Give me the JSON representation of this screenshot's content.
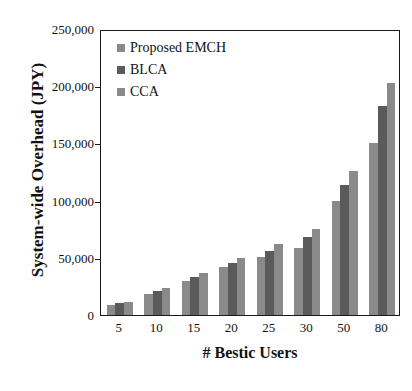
{
  "chart_data": {
    "type": "bar",
    "title": "",
    "xlabel": "# Bestic Users",
    "ylabel": "System-wide Overhead (JPY)",
    "categories": [
      "5",
      "10",
      "15",
      "20",
      "25",
      "30",
      "50",
      "80"
    ],
    "series": [
      {
        "name": "Proposed EMCH",
        "color": "#8a8a8a",
        "values": [
          9000,
          18000,
          30000,
          42000,
          51000,
          59000,
          100000,
          150000
        ]
      },
      {
        "name": "BLCA",
        "color": "#5a5a5a",
        "values": [
          10500,
          21000,
          33000,
          45500,
          56000,
          68000,
          114000,
          183000
        ]
      },
      {
        "name": "CCA",
        "color": "#8a8a8a",
        "values": [
          11500,
          24000,
          37000,
          50000,
          62000,
          75000,
          126000,
          203000
        ]
      }
    ],
    "ylim": [
      0,
      250000
    ],
    "yticks": [
      0,
      50000,
      100000,
      150000,
      200000,
      250000
    ],
    "ytick_labels": [
      "0",
      "50,000",
      "100,000",
      "150,000",
      "200,000",
      "250,000"
    ],
    "grid": false,
    "legend_position": "top-left",
    "frame": "box"
  },
  "colors": {
    "axis": "#1a1a1a",
    "text": "#111111",
    "background": "#ffffff"
  }
}
